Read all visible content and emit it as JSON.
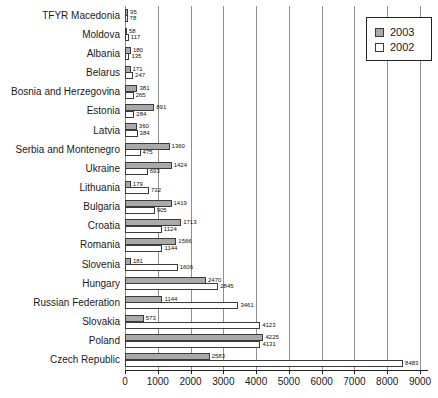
{
  "chart_data": {
    "type": "bar",
    "orientation": "horizontal",
    "title": "",
    "xlabel": "",
    "ylabel": "",
    "xlim": [
      0,
      9000
    ],
    "xticks": [
      0,
      1000,
      2000,
      3000,
      4000,
      5000,
      6000,
      7000,
      8000,
      9000
    ],
    "grid": "vertical",
    "legend_position": "top-right",
    "bar_value_labels": true,
    "categories": [
      "TFYR Macedonia",
      "Moldova",
      "Albania",
      "Belarus",
      "Bosnia and Herzegovina",
      "Estonia",
      "Latvia",
      "Serbia and Montenegro",
      "Ukraine",
      "Lithuania",
      "Bulgaria",
      "Croatia",
      "Romania",
      "Slovenia",
      "Hungary",
      "Russian Federation",
      "Slovakia",
      "Poland",
      "Czech Republic"
    ],
    "series": [
      {
        "name": "2003",
        "color": "#a9a9a9",
        "values": [
          95,
          58,
          180,
          171,
          381,
          891,
          360,
          1360,
          1424,
          179,
          1419,
          1713,
          1566,
          181,
          2470,
          1144,
          573,
          4225,
          2583
        ]
      },
      {
        "name": "2002",
        "color": "#ffffff",
        "values": [
          78,
          117,
          135,
          247,
          265,
          284,
          384,
          475,
          693,
          732,
          905,
          1124,
          1144,
          1606,
          2845,
          3461,
          4123,
          4131,
          8483
        ]
      }
    ]
  }
}
